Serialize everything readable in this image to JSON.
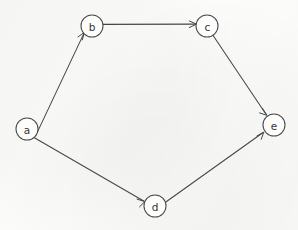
{
  "diagram": {
    "kind": "directed-graph",
    "title": "",
    "canvas": {
      "width": 298,
      "height": 230
    },
    "style": {
      "background_color": "#fcfcfa",
      "stroke_color": "#47474b",
      "node_fill_color": "#fdfdfb",
      "node_stroke_color": "#4a4a4e",
      "label_color": "#35353a",
      "node_radius": 11
    },
    "nodes": [
      {
        "id": "a",
        "label": "a",
        "cx": 27,
        "cy": 129,
        "r": 11
      },
      {
        "id": "b",
        "label": "b",
        "cx": 92,
        "cy": 26,
        "r": 11
      },
      {
        "id": "c",
        "label": "c",
        "cx": 207,
        "cy": 26,
        "r": 11
      },
      {
        "id": "d",
        "label": "d",
        "cx": 155,
        "cy": 206,
        "r": 11
      },
      {
        "id": "e",
        "label": "e",
        "cx": 274,
        "cy": 125,
        "r": 11
      }
    ],
    "edges": [
      {
        "id": "a-b",
        "from": "a",
        "to": "b",
        "directed": true,
        "label": "",
        "weight": ""
      },
      {
        "id": "b-c",
        "from": "b",
        "to": "c",
        "directed": true,
        "label": "",
        "weight": ""
      },
      {
        "id": "c-e",
        "from": "c",
        "to": "e",
        "directed": true,
        "label": "",
        "weight": ""
      },
      {
        "id": "a-d",
        "from": "a",
        "to": "d",
        "directed": true,
        "label": "",
        "weight": ""
      },
      {
        "id": "d-e",
        "from": "d",
        "to": "e",
        "directed": true,
        "label": "",
        "weight": ""
      }
    ]
  }
}
